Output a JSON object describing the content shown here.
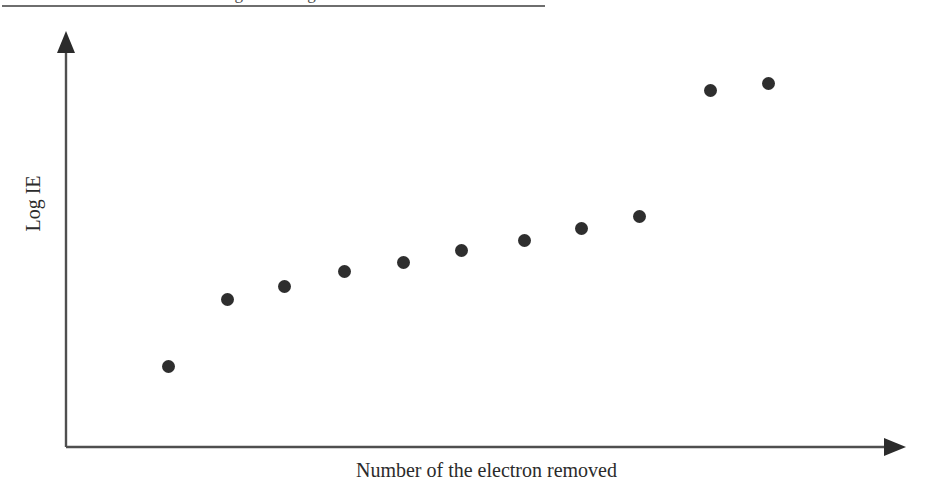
{
  "figure": {
    "background_color": "#ffffff",
    "ink_color": "#2b2b2b",
    "top_caption_partial": "successive ionization energies of magnesium",
    "top_rule": true
  },
  "axes": {
    "y_label": "Log IE",
    "x_label": "Number of the electron removed",
    "y_arrow": "arrowhead-up",
    "x_arrow": "arrowhead-right",
    "ticks": "none",
    "grid": "off",
    "axis_color": "#4f4f4f"
  },
  "chart_data": {
    "type": "scatter",
    "title": "",
    "subtitle": "",
    "xlabel": "Number of the electron removed",
    "ylabel": "Log IE",
    "grid": false,
    "legend": "none",
    "marker": {
      "shape": "circle",
      "color": "#2e2e2e",
      "size_px": 13
    },
    "xlim": [
      0,
      12
    ],
    "ylim": [
      0,
      10
    ],
    "categories": [
      1,
      2,
      3,
      4,
      5,
      6,
      7,
      8,
      9,
      10,
      11
    ],
    "x": [
      1,
      2,
      3,
      4,
      5,
      6,
      7,
      8,
      9,
      10,
      11
    ],
    "values": [
      1.95,
      3.62,
      3.94,
      4.25,
      4.55,
      4.8,
      5.05,
      5.3,
      5.55,
      8.62,
      8.77
    ],
    "series": [
      {
        "name": "Log IE",
        "values": [
          1.95,
          3.62,
          3.94,
          4.25,
          4.55,
          4.8,
          5.05,
          5.3,
          5.55,
          8.62,
          8.77
        ]
      }
    ],
    "pixel_points": [
      {
        "n": 1,
        "x": 168,
        "y": 366
      },
      {
        "n": 2,
        "x": 227,
        "y": 299
      },
      {
        "n": 3,
        "x": 284,
        "y": 286
      },
      {
        "n": 4,
        "x": 344,
        "y": 271
      },
      {
        "n": 5,
        "x": 403,
        "y": 262
      },
      {
        "n": 6,
        "x": 461,
        "y": 250
      },
      {
        "n": 7,
        "x": 524,
        "y": 240
      },
      {
        "n": 8,
        "x": 581,
        "y": 228
      },
      {
        "n": 9,
        "x": 639,
        "y": 216
      },
      {
        "n": 10,
        "x": 710,
        "y": 90
      },
      {
        "n": 11,
        "x": 768,
        "y": 83
      }
    ],
    "annotations": [
      "Large jump in Log IE between the 9th and 10th electron removed"
    ]
  }
}
